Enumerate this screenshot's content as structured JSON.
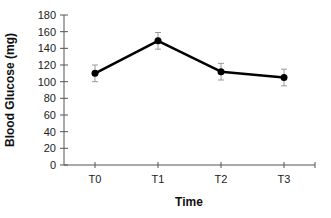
{
  "chart_data": {
    "type": "line",
    "title": "",
    "xlabel": "Time",
    "ylabel": "Blood Glucose (mg)",
    "categories": [
      "T0",
      "T1",
      "T2",
      "T3"
    ],
    "series": [
      {
        "name": "Blood Glucose",
        "values": [
          110,
          149,
          112,
          105
        ],
        "error": [
          10,
          10,
          10,
          10
        ],
        "color": "#000000"
      }
    ],
    "ylim": [
      0,
      180
    ],
    "yticks": [
      0,
      20,
      40,
      60,
      80,
      100,
      120,
      140,
      160,
      180
    ],
    "grid": false,
    "legend": "none"
  }
}
